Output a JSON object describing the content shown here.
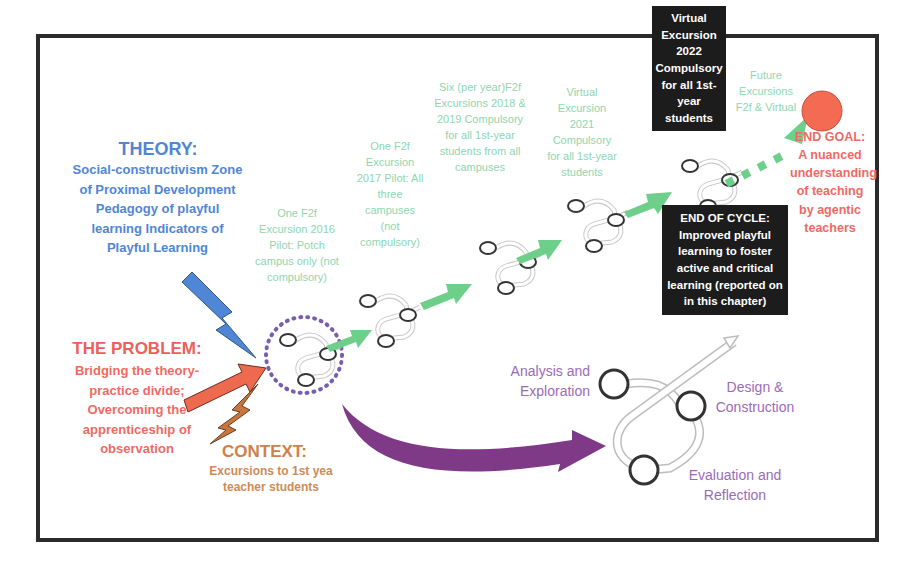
{
  "theory": {
    "title": "THEORY:",
    "items": [
      "Social-constructivism",
      "Zone of Proximal Development",
      "Pedagogy of playful learning",
      "Indicators of Playful Learning"
    ],
    "text": "Social-constructivism Zone of Proximal Development Pedagogy of playful learning Indicators of Playful Learning",
    "color": "#4f86d6"
  },
  "problem": {
    "title": "THE PROBLEM:",
    "text": "Bridging the theory-practice divide; Overcoming the apprenticeship of observation",
    "color": "#ee5f5b"
  },
  "context": {
    "title": "CONTEXT:",
    "text": "Excursions to 1st yea teacher students",
    "color": "#d0804a"
  },
  "timeline": {
    "color": "#8ed6b0",
    "stages": [
      {
        "id": "2016",
        "text": "One F2f Excursion 2016 Pilot: Potch campus only (not compulsory)"
      },
      {
        "id": "2017",
        "text": "One F2f Excursion 2017 Pilot: All three campuses (not compulsory)"
      },
      {
        "id": "2018-2019",
        "text": "Six (per year)F2f Excursions 2018 & 2019 Compulsory for all 1st-year students from all campuses"
      },
      {
        "id": "2021",
        "text": "Virtual Excursion 2021 Compulsory for all 1st-year students"
      },
      {
        "id": "2022",
        "text": "Virtual Excursion 2022 Compulsory for all 1st-year students"
      },
      {
        "id": "future",
        "text": "Future Excursions F2f & Virtual"
      }
    ]
  },
  "end_of_cycle": {
    "text": "END OF CYCLE: Improved playful learning to foster active and critical learning (reported on in this chapter)"
  },
  "end_goal": {
    "text": "END GOAL: A nuanced understanding of teaching by agentic teachers",
    "color": "#ee6a64"
  },
  "cycle": {
    "color": "#9b6bb8",
    "phases": [
      "Analysis and Exploration",
      "Design & Construction",
      "Evaluation and Reflection"
    ]
  }
}
